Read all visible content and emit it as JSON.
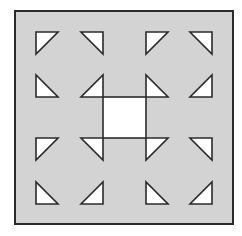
{
  "figure": {
    "colors": {
      "background": "#ffffff",
      "fill": "#d3d3d3",
      "stroke": "#2b2b2b",
      "shape_fill": "#ffffff"
    },
    "outer_square": {
      "x": 15,
      "y": 11,
      "w": 218,
      "h": 213
    },
    "center_square": {
      "x": 103,
      "y": 97,
      "w": 43,
      "h": 41
    },
    "triangles": [
      {
        "id": "r1c1",
        "x": 36,
        "y": 32,
        "size": 22,
        "right_angle": "top-left"
      },
      {
        "id": "r1c2",
        "x": 81,
        "y": 32,
        "size": 22,
        "right_angle": "top-right"
      },
      {
        "id": "r1c3",
        "x": 146,
        "y": 32,
        "size": 22,
        "right_angle": "top-left"
      },
      {
        "id": "r1c4",
        "x": 190,
        "y": 32,
        "size": 22,
        "right_angle": "top-right"
      },
      {
        "id": "r2c1",
        "x": 36,
        "y": 75,
        "size": 22,
        "right_angle": "bottom-left"
      },
      {
        "id": "r2c2",
        "x": 81,
        "y": 75,
        "size": 22,
        "right_angle": "bottom-right"
      },
      {
        "id": "r2c3",
        "x": 146,
        "y": 75,
        "size": 22,
        "right_angle": "bottom-left"
      },
      {
        "id": "r2c4",
        "x": 190,
        "y": 75,
        "size": 22,
        "right_angle": "bottom-right"
      },
      {
        "id": "r3c1",
        "x": 36,
        "y": 138,
        "size": 22,
        "right_angle": "top-left"
      },
      {
        "id": "r3c2",
        "x": 81,
        "y": 138,
        "size": 22,
        "right_angle": "top-right"
      },
      {
        "id": "r3c3",
        "x": 146,
        "y": 138,
        "size": 22,
        "right_angle": "top-left"
      },
      {
        "id": "r3c4",
        "x": 190,
        "y": 138,
        "size": 22,
        "right_angle": "top-right"
      },
      {
        "id": "r4c1",
        "x": 36,
        "y": 182,
        "size": 22,
        "right_angle": "bottom-left"
      },
      {
        "id": "r4c2",
        "x": 81,
        "y": 182,
        "size": 22,
        "right_angle": "bottom-right"
      },
      {
        "id": "r4c3",
        "x": 146,
        "y": 182,
        "size": 22,
        "right_angle": "bottom-left"
      },
      {
        "id": "r4c4",
        "x": 190,
        "y": 182,
        "size": 22,
        "right_angle": "bottom-right"
      }
    ]
  }
}
